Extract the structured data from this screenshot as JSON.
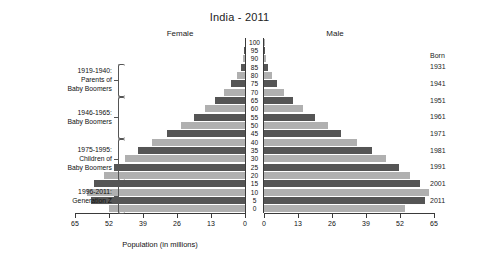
{
  "chart_data": {
    "type": "bar",
    "subtype": "population-pyramid",
    "title": "India - 2011",
    "xlabel": "Population (in millions)",
    "ylabel": "Age",
    "xlim": [
      0,
      65
    ],
    "xticks": [
      0,
      13,
      26,
      39,
      52,
      65
    ],
    "left_axis_ticks": [
      "65",
      "52",
      "39",
      "26",
      "13",
      "0"
    ],
    "right_axis_ticks": [
      "0",
      "13",
      "26",
      "39",
      "52",
      "65"
    ],
    "grid": false,
    "legend_position": "none",
    "left_series_label": "Female",
    "right_series_label": "Male",
    "age_groups": [
      "100",
      "95",
      "90",
      "85",
      "80",
      "75",
      "70",
      "65",
      "60",
      "55",
      "50",
      "45",
      "40",
      "35",
      "30",
      "25",
      "20",
      "15",
      "10",
      "5",
      "0"
    ],
    "series": [
      {
        "name": "Female",
        "values": [
          0.1,
          0.3,
          0.7,
          1.6,
          3.0,
          5.2,
          8.0,
          11.4,
          15.2,
          19.6,
          24.6,
          29.8,
          35.6,
          41.0,
          45.8,
          50.2,
          54.0,
          57.6,
          60.4,
          59.0,
          52.0
        ]
      },
      {
        "name": "Male",
        "values": [
          0.1,
          0.3,
          0.7,
          1.5,
          2.9,
          5.0,
          7.8,
          11.2,
          15.0,
          19.4,
          24.4,
          29.6,
          35.4,
          41.2,
          46.6,
          51.6,
          56.0,
          59.8,
          63.0,
          61.6,
          54.0
        ]
      }
    ],
    "bar_colors": {
      "light": "#b0b0b0",
      "dark": "#555555"
    },
    "born_header": "Born",
    "born_years": [
      "1931",
      "1941",
      "1951",
      "1961",
      "1971",
      "1981",
      "1991",
      "2001",
      "2011"
    ],
    "annotations": [
      {
        "lines": [
          "1919-1940:",
          "Parents of",
          "Baby Boomers"
        ],
        "age_from": 85,
        "age_to": 70
      },
      {
        "lines": [
          "1946-1965:",
          "Baby Boomers"
        ],
        "age_from": 65,
        "age_to": 45
      },
      {
        "lines": [
          "1975-1995:",
          "Children of",
          "Baby Boomers"
        ],
        "age_from": 40,
        "age_to": 20
      },
      {
        "lines": [
          "1996-2011:",
          "Generation Z"
        ],
        "age_from": 15,
        "age_to": 0
      }
    ]
  }
}
